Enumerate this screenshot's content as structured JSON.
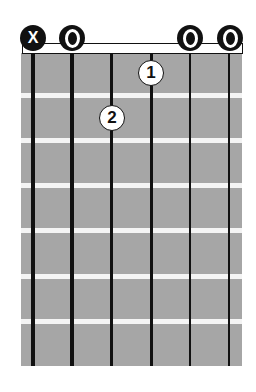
{
  "chord": {
    "strings": 6,
    "frets_shown": 7,
    "string_markers": [
      {
        "string": 1,
        "symbol": "X",
        "type": "muted"
      },
      {
        "string": 2,
        "symbol": "O",
        "type": "open"
      },
      {
        "string": 5,
        "symbol": "O",
        "type": "open"
      },
      {
        "string": 6,
        "symbol": "O",
        "type": "open"
      }
    ],
    "fingers": [
      {
        "string": 4,
        "fret": 1,
        "label": "1"
      },
      {
        "string": 3,
        "fret": 2,
        "label": "2"
      }
    ]
  },
  "colors": {
    "fretboard": "#a6a6a6",
    "fret": "#f4f4f4",
    "string": "#111111",
    "marker": "#111111"
  }
}
